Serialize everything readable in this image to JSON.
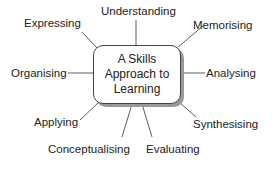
{
  "center": {
    "line1": "A Skills",
    "line2": "Approach to",
    "line3": "Learning"
  },
  "skills": [
    {
      "label": "Understanding"
    },
    {
      "label": "Expressing"
    },
    {
      "label": "Memorising"
    },
    {
      "label": "Organising"
    },
    {
      "label": "Analysing"
    },
    {
      "label": "Applying"
    },
    {
      "label": "Synthesising"
    },
    {
      "label": "Conceptualising"
    },
    {
      "label": "Evaluating"
    }
  ]
}
